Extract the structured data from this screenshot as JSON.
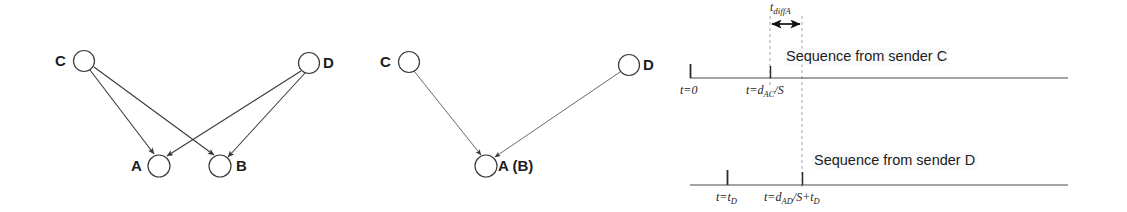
{
  "figure": {
    "background_color": "#ffffff",
    "stroke_color": "#3a3a3a",
    "text_color": "#1c1c1c"
  },
  "panel_left": {
    "name": "crossed-propagation-diagram",
    "nodes": [
      {
        "id": "C",
        "label": "C",
        "cx": 84,
        "cy": 61,
        "r": 10.5,
        "label_x": 55,
        "label_y": 54
      },
      {
        "id": "D",
        "label": "D",
        "cx": 309,
        "cy": 63,
        "r": 10.5,
        "label_x": 323,
        "label_y": 55
      },
      {
        "id": "A",
        "label": "A",
        "cx": 159,
        "cy": 166,
        "r": 11,
        "label_x": 131,
        "label_y": 159
      },
      {
        "id": "B",
        "label": "B",
        "cx": 220,
        "cy": 166,
        "r": 11,
        "label_x": 236,
        "label_y": 159
      }
    ],
    "edges": [
      {
        "from": "C",
        "to": "A"
      },
      {
        "from": "C",
        "to": "B"
      },
      {
        "from": "D",
        "to": "A"
      },
      {
        "from": "D",
        "to": "B"
      }
    ]
  },
  "panel_middle": {
    "name": "merged-receiver-diagram",
    "nodes": [
      {
        "id": "C",
        "label": "C",
        "cx": 409,
        "cy": 62,
        "r": 10.5,
        "label_x": 380,
        "label_y": 55
      },
      {
        "id": "D",
        "label": "D",
        "cx": 629,
        "cy": 65,
        "r": 10.5,
        "label_x": 643,
        "label_y": 57
      },
      {
        "id": "AB",
        "label": "A (B)",
        "cx": 486,
        "cy": 166,
        "r": 11,
        "label_x": 498,
        "label_y": 159
      }
    ],
    "edges": [
      {
        "from": "C",
        "to": "AB"
      },
      {
        "from": "D",
        "to": "AB"
      }
    ]
  },
  "panel_right": {
    "name": "timeline-diagram",
    "timeline_c": {
      "sequence_label": "Sequence from sender C",
      "axis_y": 78,
      "axis_x_start": 690,
      "axis_x_end": 1068,
      "ticks": [
        {
          "name": "t-zero-tick",
          "label_html": "t=0",
          "x": 690
        },
        {
          "name": "t-dac-tick",
          "label_html": "t=d_AC/S",
          "x": 770
        }
      ]
    },
    "timeline_d": {
      "sequence_label": "Sequence from sender D",
      "axis_y": 185,
      "axis_x_start": 690,
      "axis_x_end": 1068,
      "ticks": [
        {
          "name": "t-td-tick",
          "label_html": "t=t_D",
          "x": 727
        },
        {
          "name": "t-dad-tick",
          "label_html": "t=d_AD/S+t_D",
          "x": 802
        }
      ]
    },
    "tdiff": {
      "label": "t_diffA",
      "label_x": 772,
      "label_y": 5,
      "arrow_y": 24,
      "arrow_x_start": 770,
      "arrow_x_end": 802
    },
    "guides": [
      {
        "name": "guide-dac",
        "x": 770,
        "y_start": 18,
        "y_end": 86
      },
      {
        "name": "guide-dad",
        "x": 802,
        "y_start": 18,
        "y_end": 190
      }
    ],
    "labels": {
      "t_zero": "t=0",
      "t_dac": "t=dAC/S",
      "t_td": "t=tD",
      "t_dad": "t=dAD/S+tD",
      "tdiff": "tdiffA"
    }
  }
}
